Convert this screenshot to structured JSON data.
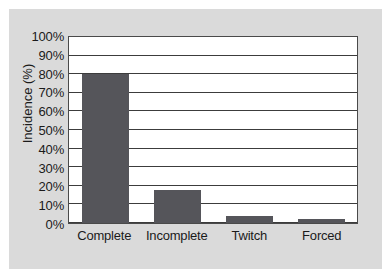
{
  "chart_data": {
    "type": "bar",
    "title": "",
    "xlabel": "",
    "ylabel": "Incidence (%)",
    "categories": [
      "Complete",
      "Incomplete",
      "Twitch",
      "Forced"
    ],
    "values": [
      80,
      17.5,
      4,
      2
    ],
    "ylim": [
      0,
      100
    ],
    "ytick_values": [
      0,
      10,
      20,
      30,
      40,
      50,
      60,
      70,
      80,
      90,
      100
    ],
    "ytick_labels": [
      "0%",
      "10%",
      "20%",
      "30%",
      "40%",
      "50%",
      "60%",
      "70%",
      "80%",
      "90%",
      "100%"
    ],
    "grid": true,
    "grid_axis": "y",
    "legend": false,
    "bar_color": "#55555a",
    "plot_background": "#ffffff",
    "figure_background": "#dadada",
    "axis_color": "#3c3c3c"
  }
}
